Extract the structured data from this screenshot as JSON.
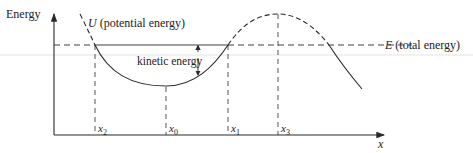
{
  "diagram": {
    "axes": {
      "y_label": "Energy",
      "x_label": "x"
    },
    "curve_label": {
      "symbol": "U",
      "text": "(potential energy)"
    },
    "total_energy_label": {
      "symbol": "E",
      "text": "(total energy)"
    },
    "kinetic_label": "kinetic energy",
    "x_ticks": [
      {
        "base": "x",
        "sub": "2"
      },
      {
        "base": "x",
        "sub": "0"
      },
      {
        "base": "x",
        "sub": "1"
      },
      {
        "base": "x",
        "sub": "3"
      }
    ],
    "colors": {
      "line": "#2a2a2a",
      "faint_band": "#e6e6e6"
    }
  }
}
